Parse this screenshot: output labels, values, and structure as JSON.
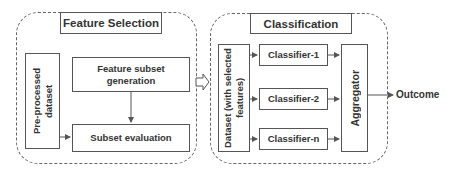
{
  "diagram": {
    "feature_selection": {
      "title": "Feature Selection",
      "input_box": "Pre-processed dataset",
      "generation_box": "Feature subset generation",
      "evaluation_box": "Subset evaluation"
    },
    "classification": {
      "title": "Classification",
      "dataset_box": "Dataset (with selected features)",
      "classifiers": [
        "Classifier-1",
        "Classifier-2",
        "Classifier-n"
      ],
      "aggregator": "Aggregator"
    },
    "output_label": "Outcome",
    "colors": {
      "line": "#555555",
      "dashed_border": "#666666",
      "text": "#333333"
    }
  }
}
